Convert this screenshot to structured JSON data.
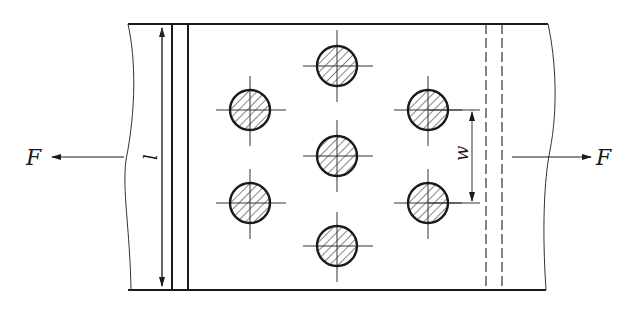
{
  "diagram": {
    "colors": {
      "line": "#1a1a1a",
      "thin": "#333333",
      "background": "#ffffff"
    },
    "labels": {
      "force_left": "F",
      "force_right": "F",
      "length_dim": "l",
      "spacing_dim": "w"
    },
    "bolts": [
      {
        "id": "bolt-1",
        "cx": 250,
        "cy": 110
      },
      {
        "id": "bolt-2",
        "cx": 250,
        "cy": 203
      },
      {
        "id": "bolt-3",
        "cx": 337,
        "cy": 66
      },
      {
        "id": "bolt-4",
        "cx": 337,
        "cy": 156
      },
      {
        "id": "bolt-5",
        "cx": 337,
        "cy": 246
      },
      {
        "id": "bolt-6",
        "cx": 428,
        "cy": 110
      },
      {
        "id": "bolt-7",
        "cx": 428,
        "cy": 203
      }
    ],
    "bolt_radius": 20
  }
}
